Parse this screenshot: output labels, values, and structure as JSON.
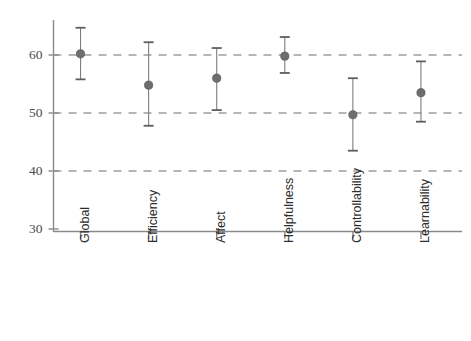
{
  "chart_data": {
    "type": "scatter",
    "title": "",
    "subtitle": "",
    "xlabel": "",
    "ylabel": "",
    "categories": [
      "Global",
      "Efficiency",
      "Affect",
      "Helpfulness",
      "Controllability",
      "Learnability"
    ],
    "values": [
      60.2,
      54.8,
      56.0,
      59.8,
      49.7,
      53.5
    ],
    "series": [
      {
        "name": "Mean with 95% CI",
        "points": [
          {
            "category": "Global",
            "mean": 60.2,
            "lower": 55.8,
            "upper": 64.7
          },
          {
            "category": "Efficiency",
            "mean": 54.8,
            "lower": 47.8,
            "upper": 62.2
          },
          {
            "category": "Affect",
            "mean": 56.0,
            "lower": 50.5,
            "upper": 61.2
          },
          {
            "category": "Helpfulness",
            "mean": 59.8,
            "lower": 56.9,
            "upper": 63.1
          },
          {
            "category": "Controllability",
            "mean": 49.7,
            "lower": 43.5,
            "upper": 56.0
          },
          {
            "category": "Learnability",
            "mean": 53.5,
            "lower": 48.5,
            "upper": 58.9
          }
        ]
      }
    ],
    "ylim": [
      30,
      66
    ],
    "yticks": [
      30,
      40,
      50,
      60
    ],
    "ytick_labels": [
      "30",
      "40",
      "50",
      "60"
    ],
    "gridlines_at": [
      40,
      50,
      60
    ],
    "grid": true,
    "grid_style": "dashed-horizontal",
    "legend": "none",
    "legend_position": "none",
    "xtick_rotation": -90,
    "marker": "filled-circle",
    "colors": {
      "marker": "#6e6e6e",
      "error_bar": "#7d7d7d",
      "gridline": "#9aa0a8",
      "axis": "#8a8a8a",
      "background": "#ffffff",
      "ytick_text": "#4a4a4a",
      "xtick_text": "#2d2d2d"
    }
  }
}
